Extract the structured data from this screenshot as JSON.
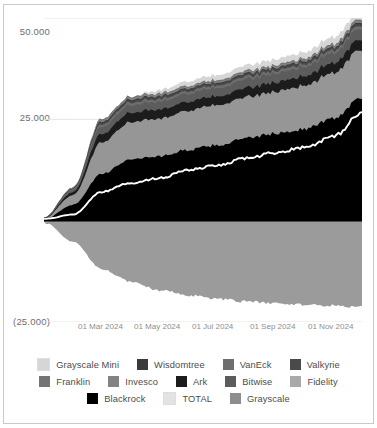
{
  "chart_data": {
    "type": "area",
    "title": "",
    "xlabel": "",
    "ylabel": "",
    "stacked": true,
    "grid": true,
    "legend_position": "bottom",
    "ylim": [
      -25000,
      50000
    ],
    "ytick_labels": [
      "50.000",
      "25.000",
      "0",
      "(25.000)"
    ],
    "ytick_values": [
      50000,
      25000,
      0,
      -25000
    ],
    "xtick_labels": [
      "01 Mar 2024",
      "01 May 2024",
      "01 Jul 2024",
      "01 Sep 2024",
      "01 Nov 2024"
    ],
    "x": [
      "01 Jan 2024",
      "01 Feb 2024",
      "01 Mar 2024",
      "01 Apr 2024",
      "01 May 2024",
      "01 Jun 2024",
      "01 Jul 2024",
      "01 Aug 2024",
      "01 Sep 2024",
      "01 Oct 2024",
      "01 Nov 2024",
      "01 Dec 2024"
    ],
    "series": [
      {
        "name": "Blackrock",
        "color": "#000000",
        "values": [
          300,
          3900,
          11500,
          15200,
          15900,
          17500,
          18600,
          20300,
          21500,
          22600,
          25200,
          30500
        ]
      },
      {
        "name": "Fidelity",
        "color": "#969696",
        "values": [
          200,
          2400,
          7800,
          9200,
          9300,
          9700,
          9900,
          10100,
          10400,
          10700,
          11300,
          11900
        ]
      },
      {
        "name": "Ark",
        "color": "#1c1c1c",
        "values": [
          100,
          700,
          2100,
          2300,
          2250,
          2200,
          2150,
          2250,
          2300,
          2350,
          2450,
          2600
        ]
      },
      {
        "name": "Bitwise",
        "color": "#5c5c5c",
        "values": [
          60,
          500,
          1700,
          1900,
          1950,
          2000,
          2050,
          2150,
          2200,
          2300,
          2450,
          2700
        ]
      },
      {
        "name": "VanEck",
        "color": "#6e6e6e",
        "values": [
          30,
          250,
          620,
          640,
          620,
          610,
          600,
          620,
          640,
          660,
          700,
          780
        ]
      },
      {
        "name": "Valkyrie",
        "color": "#4a4a4a",
        "values": [
          15,
          120,
          480,
          500,
          490,
          480,
          470,
          480,
          490,
          500,
          520,
          560
        ]
      },
      {
        "name": "Wisdomtree",
        "color": "#3a3a3a",
        "values": [
          10,
          90,
          240,
          260,
          255,
          250,
          250,
          260,
          270,
          280,
          300,
          330
        ]
      },
      {
        "name": "Invesco",
        "color": "#838383",
        "values": [
          20,
          180,
          400,
          390,
          370,
          350,
          340,
          350,
          360,
          370,
          390,
          430
        ]
      },
      {
        "name": "Franklin",
        "color": "#747474",
        "values": [
          10,
          120,
          300,
          320,
          310,
          300,
          300,
          310,
          320,
          330,
          350,
          390
        ]
      },
      {
        "name": "Grayscale Mini",
        "color": "#d6d6d6",
        "values": [
          0,
          0,
          0,
          0,
          800,
          1100,
          1250,
          1350,
          1450,
          1550,
          1700,
          1900
        ]
      },
      {
        "name": "Grayscale",
        "color": "#9b9b9b",
        "values": [
          -300,
          -5200,
          -12000,
          -15000,
          -17200,
          -18400,
          -19300,
          -20000,
          -20400,
          -20700,
          -21000,
          -21300
        ]
      }
    ],
    "overlay_line": {
      "name": "TOTAL",
      "color": "#ffffff",
      "values": [
        400,
        1500,
        7100,
        9300,
        10500,
        12500,
        13600,
        15400,
        16800,
        18100,
        20700,
        26500
      ]
    }
  },
  "legend": {
    "rows": [
      [
        {
          "label": "Grayscale Mini",
          "color": "#d6d6d6"
        },
        {
          "label": "Wisdomtree",
          "color": "#3a3a3a"
        },
        {
          "label": "VanEck",
          "color": "#6e6e6e"
        },
        {
          "label": "Valkyrie",
          "color": "#4a4a4a"
        }
      ],
      [
        {
          "label": "Franklin",
          "color": "#747474"
        },
        {
          "label": "Invesco",
          "color": "#838383"
        },
        {
          "label": "Ark",
          "color": "#1c1c1c"
        },
        {
          "label": "Bitwise",
          "color": "#5c5c5c"
        },
        {
          "label": "Fidelity",
          "color": "#a9a9a9"
        }
      ],
      [
        {
          "label": "Blackrock",
          "color": "#000000"
        },
        {
          "label": "TOTAL",
          "color": "#e3e3e3"
        },
        {
          "label": "Grayscale",
          "color": "#8d8d8d"
        }
      ]
    ]
  }
}
